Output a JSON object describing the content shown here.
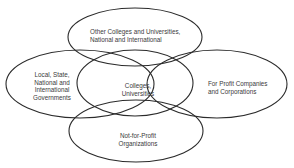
{
  "diagram": {
    "type": "venn-overlapping-ellipses",
    "stroke_color": "#2b2b2b",
    "text_color": "#3a3a3a",
    "background": "#ffffff",
    "nodes": [
      {
        "id": "top",
        "label": "Other Colleges and Universities,\nNational and International"
      },
      {
        "id": "left",
        "label": "Local, State,\nNational and\nInternational\nGovernments"
      },
      {
        "id": "center",
        "label": "Colleges,\nUniversities"
      },
      {
        "id": "right",
        "label": "For Profit Companies\nand Corporations"
      },
      {
        "id": "bottom",
        "label": "Not-for-Profit\nOrganizations"
      }
    ]
  }
}
